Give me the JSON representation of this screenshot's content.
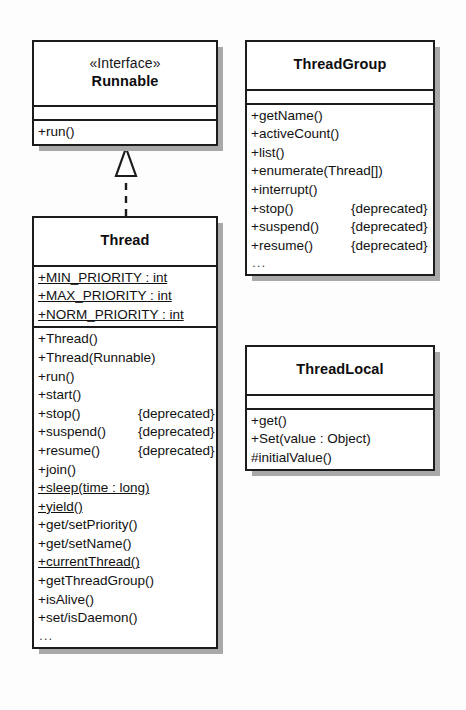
{
  "diagram": {
    "background_color": "#fdfdfd",
    "line_color": "#1c1c1c",
    "shadow_color": "#a9a9a9",
    "ellipsis": "...",
    "relationship": {
      "kind": "realization",
      "label": "",
      "from": "Thread",
      "to": "Runnable",
      "line_style": "dashed",
      "arrowhead": "hollow-triangle"
    }
  },
  "classes": {
    "runnable": {
      "stereotype": "«Interface»",
      "name": "Runnable",
      "attributes": [],
      "operations": [
        {
          "sig": "+run()",
          "note": "",
          "static": false
        }
      ],
      "truncated": false
    },
    "thread": {
      "stereotype": "",
      "name": "Thread",
      "attributes": [
        {
          "sig": "+MIN_PRIORITY : int",
          "note": "",
          "static": true
        },
        {
          "sig": "+MAX_PRIORITY : int",
          "note": "",
          "static": true
        },
        {
          "sig": "+NORM_PRIORITY : int",
          "note": "",
          "static": true
        }
      ],
      "operations": [
        {
          "sig": "+Thread()",
          "note": "",
          "static": false
        },
        {
          "sig": "+Thread(Runnable)",
          "note": "",
          "static": false
        },
        {
          "sig": "+run()",
          "note": "",
          "static": false
        },
        {
          "sig": "+start()",
          "note": "",
          "static": false
        },
        {
          "sig": "+stop()",
          "note": "{deprecated}",
          "static": false
        },
        {
          "sig": "+suspend()",
          "note": "{deprecated}",
          "static": false
        },
        {
          "sig": "+resume()",
          "note": "{deprecated}",
          "static": false
        },
        {
          "sig": "+join()",
          "note": "",
          "static": false
        },
        {
          "sig": "+sleep(time : long)",
          "note": "",
          "static": true
        },
        {
          "sig": "+yield()",
          "note": "",
          "static": true
        },
        {
          "sig": "+get/setPriority()",
          "note": "",
          "static": false
        },
        {
          "sig": "+get/setName()",
          "note": "",
          "static": false
        },
        {
          "sig": "+currentThread()",
          "note": "",
          "static": true
        },
        {
          "sig": "+getThreadGroup()",
          "note": "",
          "static": false
        },
        {
          "sig": "+isAlive()",
          "note": "",
          "static": false
        },
        {
          "sig": "+set/isDaemon()",
          "note": "",
          "static": false
        }
      ],
      "truncated": true
    },
    "threadgroup": {
      "stereotype": "",
      "name": "ThreadGroup",
      "attributes": [],
      "operations": [
        {
          "sig": "+getName()",
          "note": "",
          "static": false
        },
        {
          "sig": "+activeCount()",
          "note": "",
          "static": false
        },
        {
          "sig": "+list()",
          "note": "",
          "static": false
        },
        {
          "sig": "+enumerate(Thread[])",
          "note": "",
          "static": false
        },
        {
          "sig": "+interrupt()",
          "note": "",
          "static": false
        },
        {
          "sig": "+stop()",
          "note": "{deprecated}",
          "static": false
        },
        {
          "sig": "+suspend()",
          "note": "{deprecated}",
          "static": false
        },
        {
          "sig": "+resume()",
          "note": "{deprecated}",
          "static": false
        }
      ],
      "truncated": true
    },
    "threadlocal": {
      "stereotype": "",
      "name": "ThreadLocal",
      "attributes": [],
      "operations": [
        {
          "sig": "+get()",
          "note": "",
          "static": false
        },
        {
          "sig": "+Set(value : Object)",
          "note": "",
          "static": false
        },
        {
          "sig": "#initialValue()",
          "note": "",
          "static": false
        }
      ],
      "truncated": false
    }
  }
}
